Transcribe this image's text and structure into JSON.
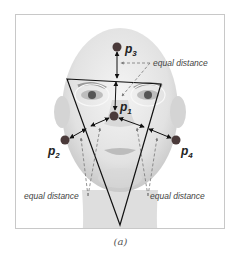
{
  "figure": {
    "caption": "(a)",
    "points": [
      {
        "id": "p1",
        "label": "p",
        "sub": "1",
        "x": 114,
        "y": 116
      },
      {
        "id": "p2",
        "label": "p",
        "sub": "2",
        "x": 65,
        "y": 140
      },
      {
        "id": "p3",
        "label": "p",
        "sub": "3",
        "x": 117,
        "y": 47
      },
      {
        "id": "p4",
        "label": "p",
        "sub": "4",
        "x": 176,
        "y": 140
      }
    ],
    "annotations": {
      "top": "equal distance",
      "bottom_left": "equal distance",
      "bottom_right": "equal distance"
    },
    "colors": {
      "point": "#4a3a3a",
      "line": "#111111",
      "dashed": "#777777",
      "face": "#d6d6d6"
    }
  }
}
